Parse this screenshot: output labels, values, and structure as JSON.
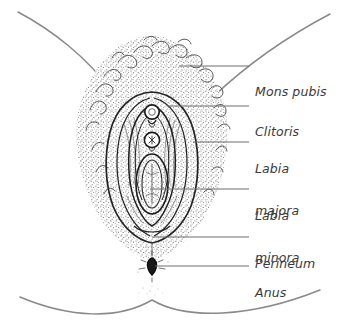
{
  "figure": {
    "style": "line-and-stipple medical illustration",
    "background_color": "#ffffff",
    "ink_color": "#2b2b2b",
    "stipple_color": "#555555",
    "leader_color": "#6e6e6e",
    "text_color": "#3a3a3a"
  },
  "labels": [
    {
      "id": "mons-pubis",
      "text": "Mons pubis",
      "lines": [
        "Mons pubis"
      ],
      "text_x": 255,
      "text_y": 57,
      "leader": {
        "x1": 179,
        "y1": 66,
        "x2": 249,
        "y2": 66,
        "kind": "horizontal"
      }
    },
    {
      "id": "clitoris",
      "text": "Clitoris",
      "lines": [
        "Clitoris"
      ],
      "text_x": 255,
      "text_y": 97,
      "leader": {
        "x1": 167,
        "y1": 106,
        "x2": 249,
        "y2": 106,
        "kind": "horizontal"
      }
    },
    {
      "id": "labia-majora",
      "text": "Labia majora",
      "lines": [
        "Labia",
        "majora"
      ],
      "text_x": 255,
      "text_y": 134,
      "leader": {
        "x1": 193,
        "y1": 142,
        "x2": 249,
        "y2": 142,
        "kind": "horizontal"
      }
    },
    {
      "id": "labia-minora",
      "text": "Labia minora",
      "lines": [
        "Labia",
        "minora"
      ],
      "text_x": 255,
      "text_y": 181,
      "leader": {
        "x1": 150,
        "y1": 189,
        "x2": 249,
        "y2": 189,
        "kind": "horizontal"
      }
    },
    {
      "id": "perineum",
      "text": "Perineum",
      "lines": [
        "Perineum"
      ],
      "text_x": 255,
      "text_y": 229,
      "leader": {
        "x1": 152,
        "y1": 237,
        "x2": 249,
        "y2": 237,
        "kind": "horizontal"
      }
    },
    {
      "id": "anus",
      "text": "Anus",
      "lines": [
        "Anus"
      ],
      "text_x": 255,
      "text_y": 258,
      "leader": {
        "x1": 155,
        "y1": 266,
        "x2": 249,
        "y2": 266,
        "kind": "horizontal"
      }
    }
  ],
  "anatomy_parts": [
    {
      "id": "mons-pubis",
      "name": "Mons pubis",
      "depiction": "stippled curly pubic hair region"
    },
    {
      "id": "clitoris",
      "name": "Clitoris",
      "depiction": "small circle at top of vestibule"
    },
    {
      "id": "urethral-opening",
      "name": "Urethral opening",
      "depiction": "small circle below clitoris"
    },
    {
      "id": "labia-majora",
      "name": "Labia majora",
      "depiction": "outer nested oval folds"
    },
    {
      "id": "labia-minora",
      "name": "Labia minora",
      "depiction": "inner nested oval folds"
    },
    {
      "id": "vaginal-opening",
      "name": "Vaginal opening",
      "depiction": "elongated nested oval"
    },
    {
      "id": "perineum",
      "name": "Perineum",
      "depiction": "midline between vulva and anus"
    },
    {
      "id": "anus",
      "name": "Anus",
      "depiction": "small dark vertical oval"
    },
    {
      "id": "thigh-upper-left",
      "name": "Upper left groin line",
      "depiction": "curve"
    },
    {
      "id": "thigh-upper-right",
      "name": "Upper right groin line",
      "depiction": "curve"
    },
    {
      "id": "buttock-lower",
      "name": "Lower buttock cleft line",
      "depiction": "shallow W curve"
    }
  ]
}
